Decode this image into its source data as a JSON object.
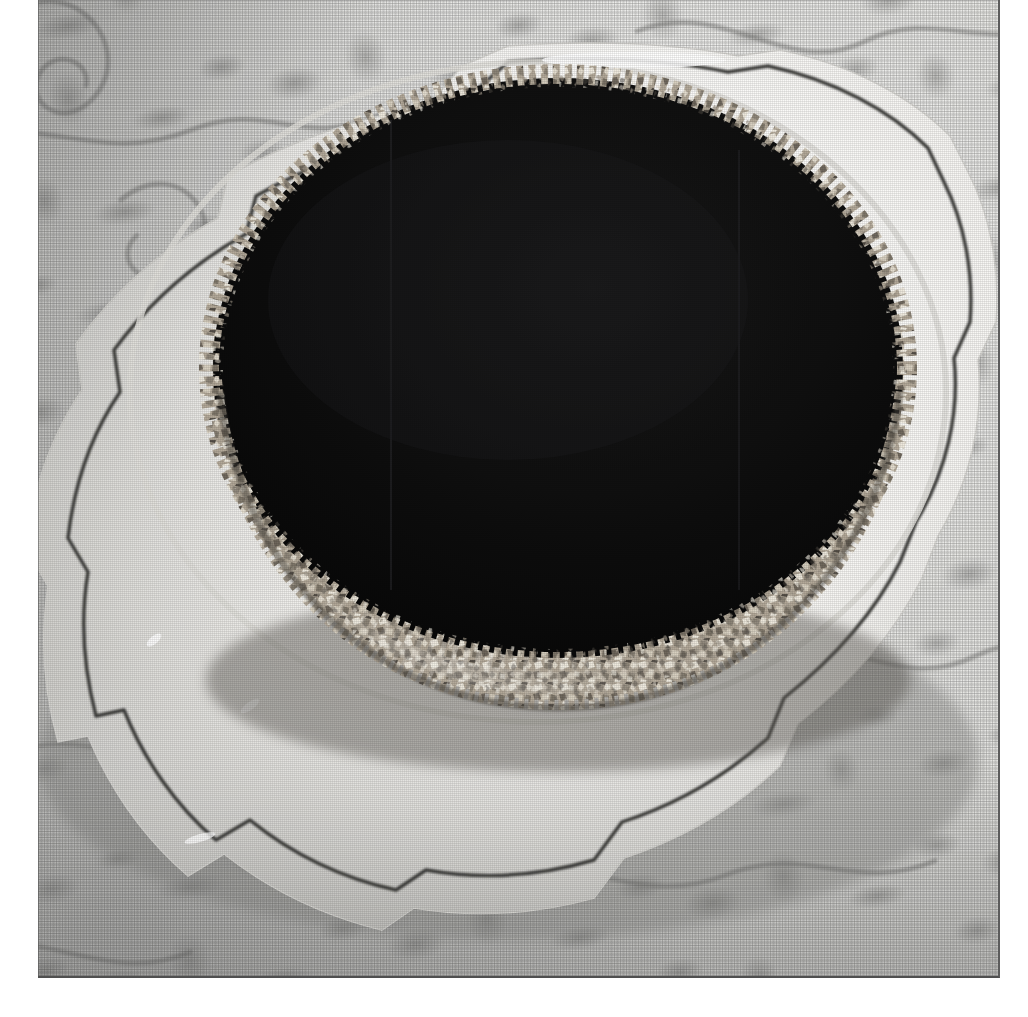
{
  "image": {
    "kind": "photograph",
    "treatment": "black-and-white",
    "title": "Chocolate glazed torte with chopped nut crust on a scalloped plate",
    "print_border": {
      "left_margin_px": 38,
      "bottom_margin_px": 39,
      "edge_line_color": "#545454"
    },
    "canvas": {
      "width": 1028,
      "height": 1017
    }
  },
  "scene": {
    "subject_label": "chocolate-torte",
    "surface_label": "damask-tablecloth",
    "serving_piece_label": "scalloped-china-plate",
    "lighting": "soft window light from upper right, shadow falls to lower left"
  },
  "colors": {
    "glaze_dark": "#0a0a0a",
    "glaze_sheen": "#26262a",
    "nut_light": "#efeae0",
    "nut_mid": "#b6ada0",
    "nut_shadow": "#4a443d",
    "plate_white": "#fbfbf9",
    "plate_shadow": "#c2c2bf",
    "plate_rim_line": "#3a3a3a",
    "cloth_base": "#e4e4e1",
    "cloth_motif": "#969694",
    "photo_border": "#545454"
  },
  "elements": {
    "cake_top_label": "chocolate-glaze-top",
    "cake_side_label": "chopped-nut-crust-side",
    "plate_rim_label": "plate-rim-pinstripe",
    "cloth_motif_label": "damask-floral-motif"
  },
  "geometry": {
    "cake_top_center": [
      520,
      368
    ],
    "cake_top_radius": [
      345,
      290
    ],
    "cake_side_height_px": 150,
    "plate_center": [
      500,
      470
    ],
    "plate_lobes": 9
  }
}
